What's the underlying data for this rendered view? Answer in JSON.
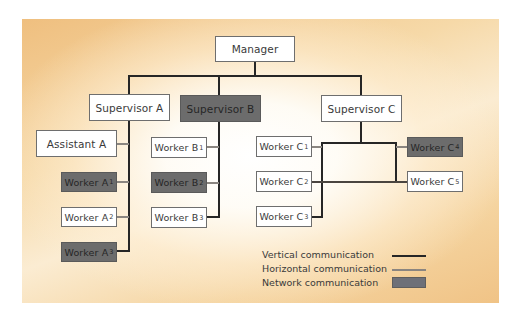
{
  "diagram": {
    "type": "organizational-communication-chart",
    "nodes": {
      "manager": {
        "label": "Manager",
        "style": "white"
      },
      "supervisor_a": {
        "label": "Supervisor A",
        "style": "white"
      },
      "supervisor_b": {
        "label": "Supervisor B",
        "style": "dark"
      },
      "supervisor_c": {
        "label": "Supervisor C",
        "style": "white"
      },
      "assistant_a": {
        "label": "Assistant A",
        "style": "white"
      },
      "worker_a1": {
        "label": "Worker A",
        "sub": "1",
        "style": "dark"
      },
      "worker_a2": {
        "label": "Worker A",
        "sub": "2",
        "style": "white"
      },
      "worker_a3": {
        "label": "Worker A",
        "sub": "3",
        "style": "dark"
      },
      "worker_b1": {
        "label": "Worker B",
        "sub": "1",
        "style": "white"
      },
      "worker_b2": {
        "label": "Worker B",
        "sub": "2",
        "style": "dark"
      },
      "worker_b3": {
        "label": "Worker B",
        "sub": "3",
        "style": "white"
      },
      "worker_c1": {
        "label": "Worker C",
        "sub": "1",
        "style": "white"
      },
      "worker_c2": {
        "label": "Worker C",
        "sub": "2",
        "style": "white"
      },
      "worker_c3": {
        "label": "Worker C",
        "sub": "3",
        "style": "white"
      },
      "worker_c4": {
        "label": "Worker C",
        "sub": "4",
        "style": "dark"
      },
      "worker_c5": {
        "label": "Worker C",
        "sub": "5",
        "style": "white"
      }
    },
    "edges": [
      {
        "from": "manager",
        "to": "supervisor_a",
        "kind": "vertical"
      },
      {
        "from": "manager",
        "to": "supervisor_b",
        "kind": "vertical"
      },
      {
        "from": "manager",
        "to": "supervisor_c",
        "kind": "vertical"
      },
      {
        "from": "supervisor_a",
        "to": "assistant_a",
        "kind": "vertical"
      },
      {
        "from": "supervisor_a",
        "to": "worker_a1",
        "kind": "vertical"
      },
      {
        "from": "supervisor_a",
        "to": "worker_a2",
        "kind": "vertical"
      },
      {
        "from": "supervisor_a",
        "to": "worker_a3",
        "kind": "vertical"
      },
      {
        "from": "supervisor_b",
        "to": "worker_b1",
        "kind": "vertical"
      },
      {
        "from": "supervisor_b",
        "to": "worker_b2",
        "kind": "vertical"
      },
      {
        "from": "supervisor_b",
        "to": "worker_b3",
        "kind": "vertical"
      },
      {
        "from": "supervisor_c",
        "to": "worker_c1",
        "kind": "vertical"
      },
      {
        "from": "supervisor_c",
        "to": "worker_c3",
        "kind": "vertical"
      },
      {
        "from": "supervisor_c",
        "to": "worker_c4",
        "kind": "vertical"
      },
      {
        "from": "supervisor_c",
        "to": "worker_c5",
        "kind": "vertical"
      },
      {
        "from": "worker_c2",
        "to": "worker_c5",
        "kind": "horizontal"
      }
    ],
    "legend": {
      "vertical": "Vertical communication",
      "horizontal": "Horizontal communication",
      "network": "Network communication"
    },
    "colors": {
      "vertical_line": "#262626",
      "horizontal_line": "#8a8580",
      "network_fill": "#6c6c6c",
      "background_edge": "#efbf7f",
      "background_center": "#ffffff"
    }
  }
}
